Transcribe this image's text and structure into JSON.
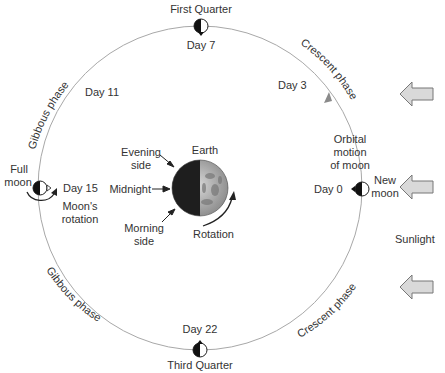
{
  "diagram": {
    "colors": {
      "orbit": "#a8a8a8",
      "text": "#333333",
      "arrow_fill": "#d9d9d9",
      "arrow_stroke": "#777777",
      "moon_dark": "#111111"
    },
    "positions": {
      "first_quarter": {
        "label": "First Quarter",
        "day": "Day 7"
      },
      "third_quarter": {
        "label": "Third Quarter",
        "day": "Day 22"
      },
      "full_moon": {
        "label_line1": "Full",
        "label_line2": "moon",
        "day": "Day 15",
        "rotation_line1": "Moon's",
        "rotation_line2": "rotation"
      },
      "new_moon": {
        "label_line1": "New",
        "label_line2": "moon",
        "day": "Day 0"
      }
    },
    "days": {
      "day3": "Day 3",
      "day11": "Day 11"
    },
    "phases": {
      "gibbous_top": "Gibbous phase",
      "gibbous_bottom": "Gibbous phase",
      "crescent_top": "Crescent phase",
      "crescent_bottom": "Crescent phase"
    },
    "orbital_motion": {
      "line1": "Orbital",
      "line2": "motion",
      "line3": "of moon"
    },
    "earth": {
      "label": "Earth",
      "evening_line1": "Evening",
      "evening_line2": "side",
      "midnight": "Midnight",
      "morning_line1": "Morning",
      "morning_line2": "side",
      "rotation": "Rotation"
    },
    "sunlight": {
      "label": "Sunlight",
      "arrow_count": 3
    }
  }
}
